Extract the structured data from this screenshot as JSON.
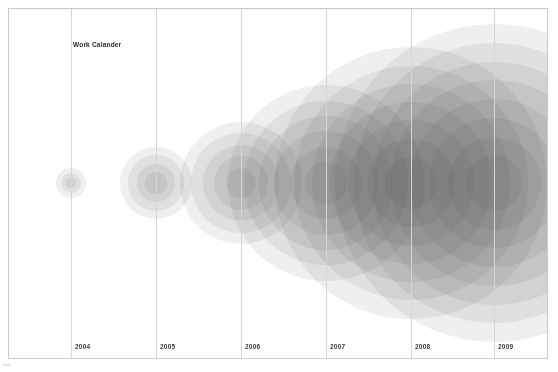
{
  "chart_title": "Work Calander",
  "footer_note": "www.",
  "colors": {
    "background": "#ffffff",
    "frame_border": "#c9c9c9",
    "gridline": "#d5d5d5",
    "label_text": "#3a3a3a",
    "title_text": "#2b2b2b",
    "bubble_fill": "rgba(70,70,70,0.085)"
  },
  "axis": {
    "tick_labels": [
      "2004",
      "2005",
      "2006",
      "2007",
      "2008",
      "2009"
    ],
    "tick_x_px": [
      70,
      155,
      240,
      325,
      410,
      493
    ]
  },
  "chart_data": {
    "type": "scatter",
    "title": "Work Calander",
    "xlabel": "",
    "ylabel": "",
    "grid": "vertical-only",
    "legend": "none",
    "x": [
      2004,
      2005,
      2006,
      2007,
      2008,
      2009
    ],
    "categories": [
      "2004",
      "2005",
      "2006",
      "2007",
      "2008",
      "2009"
    ],
    "series": [
      {
        "name": "Work volume (bubble radius, px)",
        "values": [
          14,
          34,
          58,
          92,
          128,
          150
        ]
      }
    ],
    "xlim": [
      2003.6,
      2009.7
    ],
    "annotations": [
      "Work Calander"
    ],
    "points": [
      {
        "year": 2004,
        "cx": 70,
        "cy": 182,
        "radius": 14,
        "rings": 3
      },
      {
        "year": 2005,
        "cx": 155,
        "cy": 182,
        "radius": 34,
        "rings": 4
      },
      {
        "year": 2006,
        "cx": 240,
        "cy": 182,
        "radius": 58,
        "rings": 5
      },
      {
        "year": 2007,
        "cx": 325,
        "cy": 182,
        "radius": 92,
        "rings": 6
      },
      {
        "year": 2008,
        "cx": 410,
        "cy": 182,
        "radius": 128,
        "rings": 7
      },
      {
        "year": 2009,
        "cx": 493,
        "cy": 182,
        "radius": 150,
        "rings": 8
      }
    ]
  }
}
